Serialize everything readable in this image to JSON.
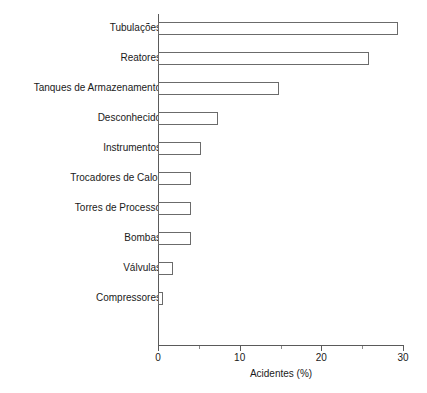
{
  "chart_data": {
    "type": "bar",
    "orientation": "horizontal",
    "title": "",
    "xlabel": "Acidentes (%)",
    "ylabel": "",
    "xlim": [
      0,
      30
    ],
    "xticks": [
      0,
      10,
      20,
      30
    ],
    "xtick_labels": [
      "0",
      "10",
      "20",
      "30"
    ],
    "xticks_minor": [
      5,
      15,
      25
    ],
    "grid": false,
    "legend": null,
    "categories": [
      "Tubulações",
      "Reatores",
      "Tanques de Armazenamento",
      "Desconhecido",
      "Instrumentos",
      "Trocadores de Calor",
      "Torres de Processo",
      "Bombas",
      "Válvulas",
      "Compressores"
    ],
    "values": [
      29.4,
      25.8,
      14.8,
      7.3,
      5.3,
      4.1,
      4.1,
      4.1,
      1.8,
      0.6
    ],
    "bar_fill": "#ffffff",
    "bar_edge": "#6b6b6b",
    "axis_color": "#5a5a5a"
  },
  "axis": {
    "xlabel": "Acidentes (%)"
  }
}
